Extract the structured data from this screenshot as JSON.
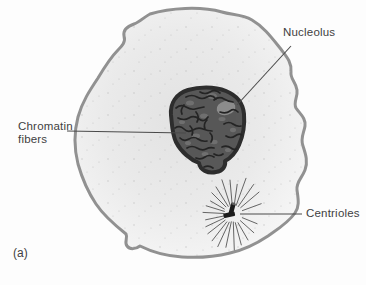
{
  "figure": {
    "panel_label": "(a)",
    "labels": {
      "nucleolus": "Nucleolus",
      "chromatin_fibers": "Chromatin fibers",
      "centrioles": "Centrioles"
    },
    "colors": {
      "background": "#fdfdfd",
      "cell_fill_center": "#e2e2e2",
      "cell_fill_mid": "#eaeaea",
      "cell_fill_edge": "#f6f6f6",
      "membrane_stroke": "#919191",
      "speckle": "#a8a8a8",
      "nucleus_fill": "#585858",
      "nucleus_envelope": "#2d2d2d",
      "chromatin_line": "#242424",
      "mottle_fill": "#737373",
      "nucleolus_fill": "#8c8c8c",
      "centriole_fill": "#1c1c1c",
      "centriole_cap": "#5e5e5e",
      "aster_ray": "#555555",
      "leader_line": "#4a4a4a",
      "label_text": "#3f3f3f"
    }
  }
}
